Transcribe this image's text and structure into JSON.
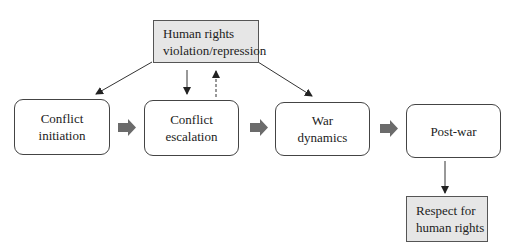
{
  "diagram": {
    "top_box": {
      "label": "Human rights\nviolation/repression"
    },
    "stages": [
      {
        "label": "Conflict\ninitiation"
      },
      {
        "label": "Conflict\nescalation"
      },
      {
        "label": "War\ndynamics"
      },
      {
        "label": "Post-war"
      }
    ],
    "bottom_box": {
      "label": "Respect for\nhuman rights"
    },
    "edges": [
      {
        "from": "top_box",
        "to": "stages.0",
        "style": "solid-thin"
      },
      {
        "from": "top_box",
        "to": "stages.1",
        "style": "solid-thin"
      },
      {
        "from": "stages.1",
        "to": "top_box",
        "style": "dashed-thin"
      },
      {
        "from": "top_box",
        "to": "stages.2",
        "style": "solid-thin"
      },
      {
        "from": "stages.0",
        "to": "stages.1",
        "style": "block-arrow"
      },
      {
        "from": "stages.1",
        "to": "stages.2",
        "style": "block-arrow"
      },
      {
        "from": "stages.2",
        "to": "stages.3",
        "style": "block-arrow"
      },
      {
        "from": "stages.3",
        "to": "bottom_box",
        "style": "solid-thin"
      }
    ],
    "colors": {
      "shaded_fill": "#e6e6e6",
      "block_arrow": "#6b6b6b",
      "line": "#333333"
    }
  }
}
